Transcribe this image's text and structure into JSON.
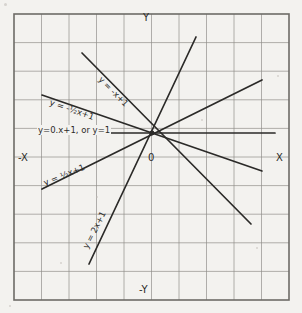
{
  "figure": {
    "kind": "hand-drawn-graph-paper",
    "background_color": "#f3f2ef",
    "grid_color": "#8e8c88",
    "frame_color": "#55535012",
    "ink_color": "#2b2a28",
    "frame": {
      "x": 14,
      "y": 14,
      "width": 275,
      "height": 286
    },
    "grid": {
      "cell_w": 27.5,
      "cell_h": 28.6,
      "cols": 10,
      "rows": 10
    },
    "origin_marker": {
      "x": 152,
      "y": 133
    }
  },
  "axis_labels": {
    "y_positive": "Y",
    "y_negative": "-Y",
    "x_positive": "X",
    "x_negative": "-X",
    "origin": "0"
  },
  "chart_data": {
    "type": "line",
    "title": "",
    "xlabel": "X",
    "ylabel": "Y",
    "grid": true,
    "legend": "inline-annotations",
    "xlim": [
      -5,
      5
    ],
    "ylim": [
      -5,
      5
    ],
    "common_point": {
      "x": 0,
      "y": 1
    },
    "series": [
      {
        "name": "y = -x+1",
        "label": "y = -x+1",
        "slope": -1,
        "intercept": 1,
        "pixels": {
          "x1": 82,
          "y1": 53,
          "x2": 251,
          "y2": 224
        },
        "label_pixels": {
          "x": 100,
          "y": 73,
          "rotate": 45
        }
      },
      {
        "name": "y = -1/2x+1",
        "label": "y = -½x+1",
        "slope": -0.5,
        "intercept": 1,
        "pixels": {
          "x1": 42,
          "y1": 95,
          "x2": 262,
          "y2": 171
        },
        "label_pixels": {
          "x": 50,
          "y": 97,
          "rotate": 19
        }
      },
      {
        "name": "y = 0x+1",
        "label": "y=0.x+1, or y=1",
        "slope": 0,
        "intercept": 1,
        "pixels": {
          "x1": 39,
          "y1": 133,
          "x2": 275,
          "y2": 133
        },
        "label_pixels": {
          "x": 37,
          "y": 125,
          "rotate": 0
        }
      },
      {
        "name": "y = 1/2x+1",
        "label": "y = ½x+1",
        "slope": 0.5,
        "intercept": 1,
        "pixels": {
          "x1": 42,
          "y1": 189,
          "x2": 262,
          "y2": 80
        },
        "label_pixels": {
          "x": 44,
          "y": 178,
          "rotate": -22
        }
      },
      {
        "name": "y = 2x+1",
        "label": "y = 2x+1",
        "slope": 2,
        "intercept": 1,
        "pixels": {
          "x1": 89,
          "y1": 264,
          "x2": 196,
          "y2": 37
        },
        "label_pixels": {
          "x": 85,
          "y": 243,
          "rotate": -63
        }
      }
    ]
  }
}
